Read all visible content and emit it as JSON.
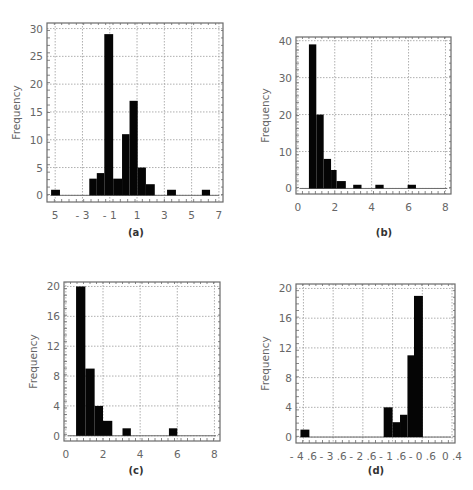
{
  "chart_data": [
    {
      "id": "a",
      "type": "bar",
      "caption": "(a)",
      "title": "",
      "xlabel": "",
      "ylabel": "Frequency",
      "xlim": [
        -5.6,
        7.3
      ],
      "ylim": [
        -1.2,
        31
      ],
      "xticks": [
        -5,
        -3,
        -1,
        1,
        3,
        5,
        7
      ],
      "xtick_labels": [
        "5",
        "- 3",
        "- 1",
        "1",
        "3",
        "5",
        "7"
      ],
      "yticks": [
        0,
        5,
        10,
        15,
        20,
        25,
        30
      ],
      "ytick_labels": [
        "0",
        "5",
        "10",
        "15",
        "20",
        "25",
        "30"
      ],
      "grid": true,
      "bins": [
        {
          "x0": -5.3,
          "x1": -4.65,
          "count": 1
        },
        {
          "x0": -2.5,
          "x1": -1.95,
          "count": 3
        },
        {
          "x0": -1.95,
          "x1": -1.4,
          "count": 4
        },
        {
          "x0": -1.4,
          "x1": -0.75,
          "count": 29
        },
        {
          "x0": -0.75,
          "x1": -0.1,
          "count": 3
        },
        {
          "x0": -0.1,
          "x1": 0.45,
          "count": 11
        },
        {
          "x0": 0.45,
          "x1": 1.05,
          "count": 17
        },
        {
          "x0": 1.05,
          "x1": 1.65,
          "count": 5
        },
        {
          "x0": 1.65,
          "x1": 2.3,
          "count": 2
        },
        {
          "x0": 3.2,
          "x1": 3.85,
          "count": 1
        },
        {
          "x0": 5.75,
          "x1": 6.35,
          "count": 1
        }
      ]
    },
    {
      "id": "b",
      "type": "bar",
      "caption": "(b)",
      "title": "",
      "xlabel": "",
      "ylabel": "Frequency",
      "xlim": [
        -0.1,
        8.3
      ],
      "ylim": [
        -1.5,
        41
      ],
      "xticks": [
        0,
        2,
        4,
        6,
        8
      ],
      "xtick_labels": [
        "0",
        "2",
        "4",
        "6",
        "8"
      ],
      "yticks": [
        0,
        10,
        20,
        30,
        40
      ],
      "ytick_labels": [
        "0",
        "10",
        "20",
        "30",
        "40"
      ],
      "grid": true,
      "bins": [
        {
          "x0": 0.6,
          "x1": 1.0,
          "count": 39
        },
        {
          "x0": 1.0,
          "x1": 1.4,
          "count": 20
        },
        {
          "x0": 1.4,
          "x1": 1.8,
          "count": 8
        },
        {
          "x0": 1.8,
          "x1": 2.1,
          "count": 5
        },
        {
          "x0": 2.1,
          "x1": 2.6,
          "count": 2
        },
        {
          "x0": 3.0,
          "x1": 3.45,
          "count": 1
        },
        {
          "x0": 4.2,
          "x1": 4.65,
          "count": 1
        },
        {
          "x0": 5.95,
          "x1": 6.4,
          "count": 1
        }
      ]
    },
    {
      "id": "c",
      "type": "bar",
      "caption": "(c)",
      "title": "",
      "xlabel": "",
      "ylabel": "Frequency",
      "xlim": [
        -0.1,
        8.3
      ],
      "ylim": [
        -0.7,
        20.6
      ],
      "xticks": [
        0,
        2,
        4,
        6,
        8
      ],
      "xtick_labels": [
        "0",
        "2",
        "4",
        "6",
        "8"
      ],
      "yticks": [
        0,
        4,
        8,
        12,
        16,
        20
      ],
      "ytick_labels": [
        "0",
        "4",
        "8",
        "12",
        "16",
        "20"
      ],
      "grid": true,
      "bins": [
        {
          "x0": 0.55,
          "x1": 1.05,
          "count": 20
        },
        {
          "x0": 1.05,
          "x1": 1.55,
          "count": 9
        },
        {
          "x0": 1.55,
          "x1": 2.0,
          "count": 4
        },
        {
          "x0": 2.0,
          "x1": 2.5,
          "count": 2
        },
        {
          "x0": 3.05,
          "x1": 3.5,
          "count": 1
        },
        {
          "x0": 5.55,
          "x1": 6.0,
          "count": 1
        }
      ]
    },
    {
      "id": "d",
      "type": "bar",
      "caption": "(d)",
      "title": "",
      "xlabel": "",
      "ylabel": "Frequency",
      "xlim": [
        -4.85,
        0.5
      ],
      "ylim": [
        -0.8,
        20.6
      ],
      "xticks": [
        -4.6,
        -3.6,
        -2.6,
        -1.6,
        -0.6,
        0.4
      ],
      "xtick_labels": [
        "- 4 .6",
        "- 3 .6",
        "- 2 .6",
        "- 1 .6",
        "- 0 .6",
        "0 .4"
      ],
      "yticks": [
        0,
        4,
        8,
        12,
        16,
        20
      ],
      "ytick_labels": [
        "0",
        "4",
        "8",
        "12",
        "16",
        "20"
      ],
      "grid": true,
      "bins": [
        {
          "x0": -4.7,
          "x1": -4.4,
          "count": 1
        },
        {
          "x0": -1.9,
          "x1": -1.6,
          "count": 4
        },
        {
          "x0": -1.6,
          "x1": -1.35,
          "count": 2
        },
        {
          "x0": -1.35,
          "x1": -1.1,
          "count": 3
        },
        {
          "x0": -1.1,
          "x1": -0.88,
          "count": 11
        },
        {
          "x0": -0.88,
          "x1": -0.58,
          "count": 19
        }
      ]
    }
  ]
}
